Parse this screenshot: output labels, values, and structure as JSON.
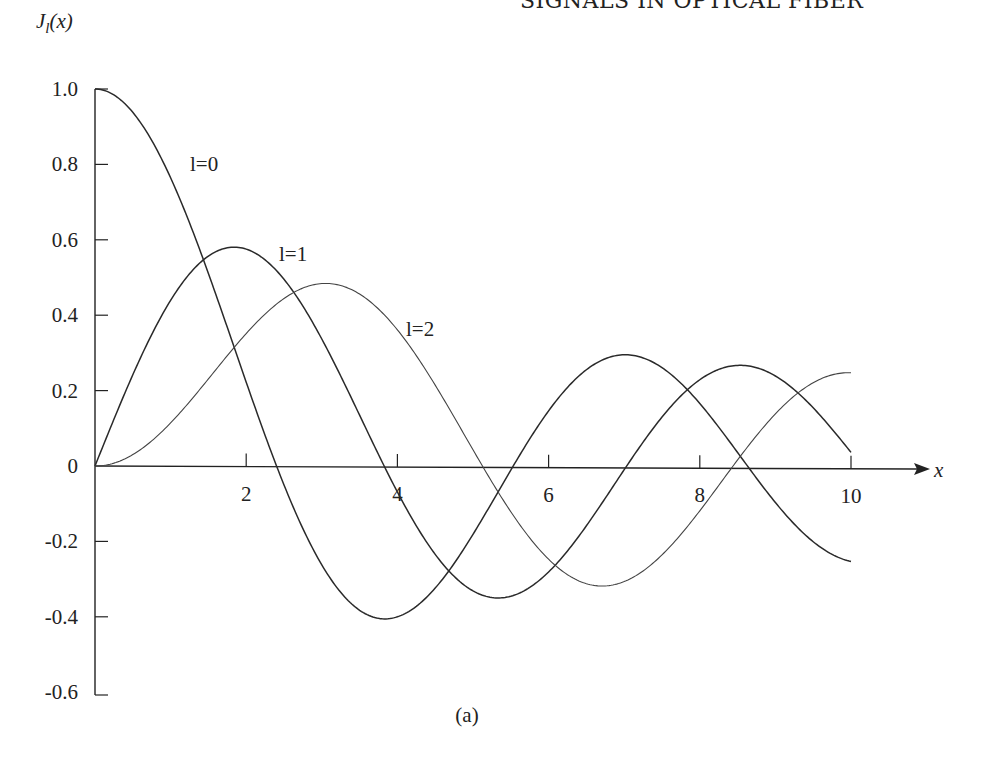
{
  "page": {
    "running_head": "SIGNALS IN OPTICAL FIBER",
    "caption": "(a)"
  },
  "chart_data": {
    "type": "line",
    "title": "",
    "ylabel": "J_l(x)",
    "xlabel": "x",
    "xlim": [
      0,
      10
    ],
    "ylim": [
      -0.6,
      1.0
    ],
    "grid": false,
    "legend": "inline labels on curves",
    "x_ticks": [
      2,
      4,
      6,
      8,
      10
    ],
    "x_tick_labels": [
      "2",
      "4",
      "6",
      "8",
      "10"
    ],
    "y_ticks": [
      1.0,
      0.8,
      0.6,
      0.4,
      0.2,
      0,
      -0.2,
      -0.4,
      -0.6
    ],
    "y_tick_labels": [
      "1.0",
      "0.8",
      "0.6",
      "0.4",
      "0.2",
      "0",
      "-0.2",
      "-0.4",
      "-0.6"
    ],
    "x": [
      0,
      0.5,
      1,
      1.5,
      2,
      2.5,
      3,
      3.5,
      4,
      4.5,
      5,
      5.5,
      6,
      6.5,
      7,
      7.5,
      8,
      8.5,
      9,
      9.5,
      10
    ],
    "series": [
      {
        "name": "l=0",
        "values": [
          1.0,
          0.938,
          0.765,
          0.512,
          0.224,
          -0.048,
          -0.26,
          -0.38,
          -0.397,
          -0.321,
          -0.178,
          -0.007,
          0.151,
          0.26,
          0.3,
          0.266,
          0.172,
          0.042,
          -0.09,
          -0.194,
          -0.246
        ]
      },
      {
        "name": "l=1",
        "values": [
          0.0,
          0.242,
          0.44,
          0.558,
          0.577,
          0.497,
          0.339,
          0.137,
          -0.066,
          -0.231,
          -0.328,
          -0.341,
          -0.277,
          -0.154,
          -0.005,
          0.135,
          0.235,
          0.273,
          0.245,
          0.161,
          0.043
        ]
      },
      {
        "name": "l=2",
        "values": [
          0.0,
          0.031,
          0.115,
          0.232,
          0.353,
          0.446,
          0.486,
          0.459,
          0.364,
          0.218,
          0.047,
          -0.117,
          -0.243,
          -0.307,
          -0.301,
          -0.23,
          -0.113,
          0.022,
          0.145,
          0.228,
          0.255
        ]
      }
    ],
    "annotations": [
      {
        "text": "l=0",
        "x": 1.3,
        "y": 0.79
      },
      {
        "text": "l=1",
        "x": 2.4,
        "y": 0.52
      },
      {
        "text": "l=2",
        "x": 4.1,
        "y": 0.34
      }
    ]
  }
}
